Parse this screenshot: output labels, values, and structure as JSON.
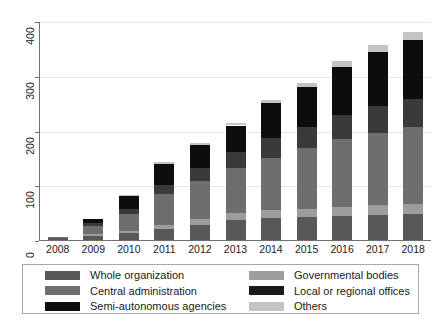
{
  "chart_data": {
    "type": "bar",
    "subtype": "stacked-bar",
    "title": "",
    "xlabel": "",
    "ylabel": "",
    "grid": true,
    "ylim": [
      0,
      400
    ],
    "yticks": [
      0,
      100,
      200,
      300,
      400
    ],
    "ytick_labels": [
      "0",
      "100",
      "200",
      "300",
      "400"
    ],
    "categories": [
      "2008",
      "2009",
      "2010",
      "2011",
      "2012",
      "2013",
      "2014",
      "2015",
      "2016",
      "2017",
      "2018"
    ],
    "legend_position": "bottom",
    "stack_order_bottom_to_top": [
      "Whole organization",
      "Governmental bodies",
      "Central administration",
      "Local or regional offices",
      "Semi-autonomous agencies",
      "Others"
    ],
    "series": [
      {
        "name": "Whole organization",
        "color": "#58585a",
        "values": [
          5,
          10,
          14,
          22,
          30,
          38,
          42,
          44,
          46,
          48,
          50
        ]
      },
      {
        "name": "Governmental bodies",
        "color": "#9d9d9f",
        "values": [
          1,
          3,
          5,
          8,
          11,
          13,
          14,
          15,
          16,
          17,
          18
        ]
      },
      {
        "name": "Central administration",
        "color": "#6e6e70",
        "values": [
          2,
          14,
          30,
          55,
          68,
          82,
          96,
          110,
          124,
          133,
          140
        ]
      },
      {
        "name": "Local or regional offices",
        "color": "#3a3a3c",
        "values": [
          0,
          5,
          10,
          18,
          24,
          30,
          36,
          40,
          44,
          48,
          52
        ]
      },
      {
        "name": "Semi-autonomous agencies",
        "color": "#0d0d0d",
        "values": [
          0,
          8,
          23,
          38,
          42,
          48,
          64,
          72,
          88,
          100,
          108
        ]
      },
      {
        "name": "Others",
        "color": "#c4c4c4",
        "values": [
          0,
          0,
          2,
          3,
          4,
          4,
          6,
          8,
          10,
          12,
          14
        ]
      }
    ],
    "totals": [
      8,
      40,
      84,
      144,
      179,
      215,
      258,
      289,
      328,
      358,
      382
    ]
  },
  "legend": {
    "entries": [
      {
        "label": "Whole organization",
        "color": "#58585a"
      },
      {
        "label": "Central administration",
        "color": "#6e6e70"
      },
      {
        "label": "Semi-autonomous agencies",
        "color": "#0d0d0d"
      },
      {
        "label": "Governmental bodies",
        "color": "#9d9d9f"
      },
      {
        "label": "Local or regional offices",
        "color": "#1a1a1a"
      },
      {
        "label": "Others",
        "color": "#c4c4c4"
      }
    ]
  }
}
